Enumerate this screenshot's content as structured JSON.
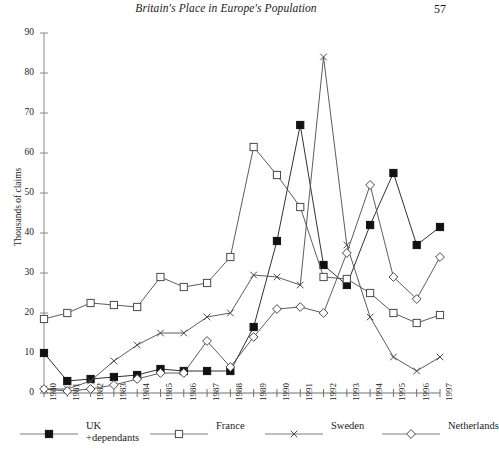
{
  "running_head": {
    "title": "Britain's Place in Europe's Population",
    "folio": "57"
  },
  "chart_data": {
    "type": "line",
    "title": "",
    "xlabel": "",
    "ylabel": "Thousands of claims",
    "ylim": [
      0,
      90
    ],
    "ytick_step": 10,
    "yticks": [
      "0",
      "10",
      "20",
      "30",
      "40",
      "50",
      "60",
      "70",
      "80",
      "90"
    ],
    "grid": false,
    "legend_position": "bottom",
    "categories": [
      "1980",
      "1981",
      "1982",
      "1983",
      "1984",
      "1985",
      "1986",
      "1987",
      "1988",
      "1989",
      "1990",
      "1991",
      "1992",
      "1993",
      "1994",
      "1995",
      "1996",
      "1997"
    ],
    "series": [
      {
        "name": "UK",
        "sub_name": "+dependants",
        "marker": "filled-square",
        "color": "#1a1a1a",
        "values": [
          10,
          3,
          3.5,
          4,
          4.5,
          6,
          5.5,
          5.5,
          5.5,
          16.5,
          38,
          67,
          32,
          27,
          42,
          55,
          37,
          41.5
        ]
      },
      {
        "name": "France",
        "marker": "open-square",
        "color": "#4a4a4a",
        "values": [
          18.5,
          20,
          22.5,
          22,
          21.5,
          29,
          26.5,
          27.5,
          34,
          61.5,
          54.5,
          46.5,
          29,
          28.5,
          25,
          20,
          17.5,
          19.5
        ]
      },
      {
        "name": "Sweden",
        "marker": "cross",
        "color": "#4a4a4a",
        "values": [
          1,
          1,
          3,
          8,
          12,
          15,
          15,
          19,
          20,
          29.5,
          29,
          27,
          84,
          37,
          19,
          9,
          5.5,
          9
        ]
      },
      {
        "name": "Netherlands",
        "marker": "open-diamond",
        "color": "#4a4a4a",
        "values": [
          1,
          0.5,
          1,
          2,
          3.5,
          5,
          5,
          13,
          6.5,
          14,
          21,
          21.5,
          20,
          35,
          52,
          29,
          23.5,
          34
        ]
      }
    ]
  },
  "legend": {
    "items": [
      {
        "label": "UK",
        "sub_label": "+dependants",
        "marker": "filled-square"
      },
      {
        "label": "France",
        "sub_label": "",
        "marker": "open-square"
      },
      {
        "label": "Sweden",
        "sub_label": "",
        "marker": "cross"
      },
      {
        "label": "Netherlands",
        "sub_label": "",
        "marker": "open-diamond"
      }
    ]
  }
}
